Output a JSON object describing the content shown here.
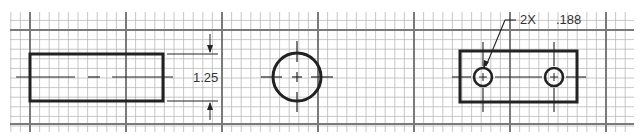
{
  "drawing": {
    "title": "",
    "grid": {
      "x0": 10,
      "x1": 634,
      "y0": 12,
      "y1": 132,
      "minor_spacing": 9.6,
      "major_x": [
        30,
        126,
        222,
        318,
        414,
        510,
        606
      ],
      "major_y": [
        30,
        124
      ],
      "minor_color": "#b9b9b9",
      "major_color": "#7a7a7a"
    },
    "views": {
      "front": {
        "rect": {
          "x": 30,
          "y": 54,
          "w": 133,
          "h": 47
        },
        "dimension": {
          "label": "1.25"
        }
      },
      "end": {
        "circle": {
          "cx": 297,
          "cy": 77,
          "r": 24
        }
      },
      "top": {
        "rect": {
          "x": 460,
          "y": 51,
          "w": 117,
          "h": 51
        },
        "holes": [
          {
            "cx": 483,
            "cy": 77,
            "r": 9
          },
          {
            "cx": 554,
            "cy": 77,
            "r": 9
          }
        ],
        "callout": {
          "count": "2X",
          "diameter": ".188"
        }
      }
    },
    "line_color": "#222222"
  }
}
